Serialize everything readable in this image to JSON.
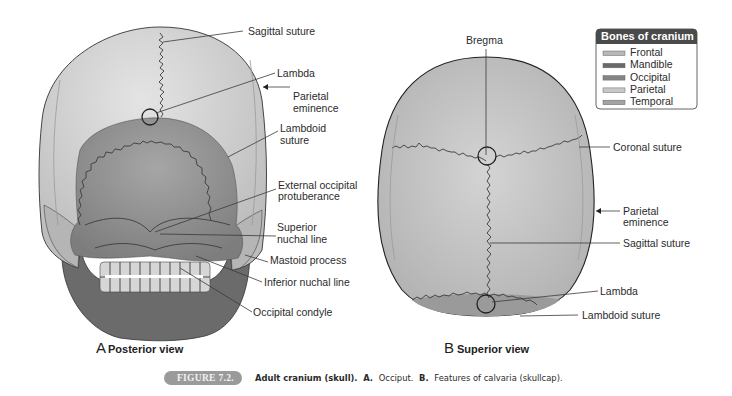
{
  "figure": {
    "number_badge": "FIGURE 7.2.",
    "caption": {
      "title": "Adult cranium (skull).",
      "part_a_label": "A.",
      "part_a_text": "Occiput.",
      "part_b_label": "B.",
      "part_b_text": "Features of calvaria (skullcap)."
    }
  },
  "legend": {
    "title": "Bones of cranium",
    "items": [
      {
        "label": "Frontal",
        "color": "#b8b8b8"
      },
      {
        "label": "Mandible",
        "color": "#6a6a6a"
      },
      {
        "label": "Occipital",
        "color": "#858585"
      },
      {
        "label": "Parietal",
        "color": "#c8c8c8"
      },
      {
        "label": "Temporal",
        "color": "#a4a4a4"
      }
    ],
    "header_color": "#4a4a4a"
  },
  "colors": {
    "parietal": "#cfcfcf",
    "occipital": "#8f8f8f",
    "mandible": "#6b6b6b",
    "temporal": "#b0b0b0",
    "frontal": "#c4c4c4",
    "badge": "#9a9a9a"
  },
  "panel_a": {
    "letter": "A",
    "title": "Posterior view",
    "labels": {
      "sagittal_suture": "Sagittal suture",
      "lambda": "Lambda",
      "parietal_eminence_1": "Parietal",
      "parietal_eminence_2": "eminence",
      "lambdoid_suture_1": "Lambdoid",
      "lambdoid_suture_2": "suture",
      "ext_occ_prot_1": "External occipital",
      "ext_occ_prot_2": "protuberance",
      "sup_nuchal_1": "Superior",
      "sup_nuchal_2": "nuchal line",
      "mastoid": "Mastoid process",
      "inf_nuchal": "Inferior nuchal line",
      "occ_condyle": "Occipital condyle"
    }
  },
  "panel_b": {
    "letter": "B",
    "title": "Superior view",
    "labels": {
      "bregma": "Bregma",
      "coronal_suture": "Coronal suture",
      "parietal_eminence_1": "Parietal",
      "parietal_eminence_2": "eminence",
      "sagittal_suture": "Sagittal suture",
      "lambda": "Lambda",
      "lambdoid_suture": "Lambdoid suture"
    }
  }
}
